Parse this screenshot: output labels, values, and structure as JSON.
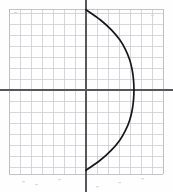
{
  "figure": {
    "background_color": "#fdfdfd",
    "grid": {
      "minor_color": "#c9c9cf",
      "edge_color": "#bcbcc4",
      "cell_size_px": 11,
      "left_px": 9,
      "top_px": 9,
      "right_px": 163,
      "bottom_px": 174,
      "columns": 14,
      "rows": 15,
      "grid_on": true
    },
    "axes": {
      "color": "#56565c",
      "origin_px": {
        "x": 86,
        "y": 90
      },
      "x_axis_y_px": 90,
      "y_axis_x_px": 86,
      "x_axis_from_px": 0,
      "x_axis_to_px": 173,
      "y_axis_from_px": 0,
      "y_axis_to_px": 192,
      "tick_labels_shown": false
    },
    "curve": {
      "color": "#17171a",
      "stroke_width_px": 1.7,
      "shape": "parabola-opening-left",
      "vertex_px": {
        "x": 134,
        "y": 90
      },
      "top_endpoint_px": {
        "x": 86,
        "y": 10
      },
      "bottom_endpoint_px": {
        "x": 86,
        "y": 170
      }
    }
  },
  "chart_data": {
    "type": "line",
    "title": "",
    "subtitle": "",
    "xlabel": "",
    "ylabel": "",
    "grid": true,
    "legend_position": "none",
    "units_per_cell": 1,
    "xlim": [
      -7,
      7
    ],
    "ylim": [
      -7.4,
      7.4
    ],
    "xticks": [
      -7,
      -6,
      -5,
      -4,
      -3,
      -2,
      -1,
      0,
      1,
      2,
      3,
      4,
      5,
      6,
      7
    ],
    "yticks": [
      -7,
      -6,
      -5,
      -4,
      -3,
      -2,
      -1,
      0,
      1,
      2,
      3,
      4,
      5,
      6,
      7
    ],
    "tick_labels": [],
    "annotations": [],
    "series": [
      {
        "name": "parabola",
        "equation": "x = 4.36 - 0.0818*y^2",
        "vertex": [
          4.36,
          0
        ],
        "opens": "left",
        "x": [
          0.0,
          1.29,
          2.31,
          3.07,
          3.6,
          3.97,
          4.2,
          4.32,
          4.36,
          4.32,
          4.2,
          3.97,
          3.6,
          3.07,
          2.31,
          1.29,
          0.0
        ],
        "y": [
          -7.3,
          -6.39,
          -5.47,
          -4.56,
          -3.65,
          -2.74,
          -1.82,
          -0.91,
          0.0,
          0.91,
          1.82,
          2.74,
          3.65,
          4.56,
          5.47,
          6.39,
          7.3
        ]
      }
    ]
  }
}
